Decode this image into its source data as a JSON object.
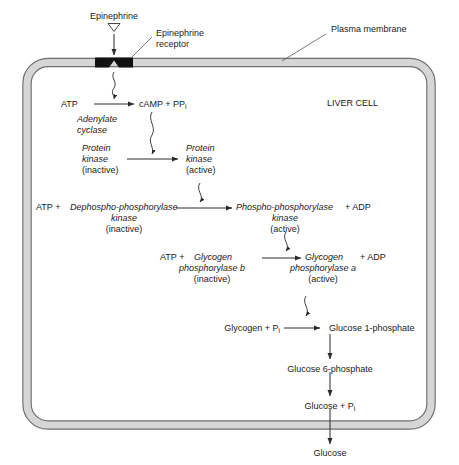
{
  "diagram": {
    "title_region": {
      "epinephrine": "Epinephrine",
      "epinephrine_receptor_line1": "Epinephrine",
      "epinephrine_receptor_line2": "receptor",
      "plasma_membrane": "Plasma membrane",
      "liver_cell": "LIVER CELL"
    },
    "step_camp": {
      "substrate": "ATP",
      "product": "cAMP + PP",
      "product_sub": "i",
      "enzyme_line1": "Adenylate",
      "enzyme_line2": "cyclase"
    },
    "step_protein_kinase": {
      "left_line1": "Protein",
      "left_line2": "kinase",
      "left_line3": "(inactive)",
      "right_line1": "Protein",
      "right_line2": "kinase",
      "right_line3": "(active)"
    },
    "step_phosphorylase_kinase": {
      "atp": "ATP +",
      "left_line1": "Dephospho-phosphorylase",
      "left_line2": "kinase",
      "left_line3": "(inactive)",
      "right_line1": "Phospho-phosphorylase",
      "right_line2": "kinase",
      "right_line3": "(active)",
      "adp": "+ ADP"
    },
    "step_glycogen_phosphorylase": {
      "atp": "ATP +",
      "left_line1": "Glycogen",
      "left_line2": "phosphorylase b",
      "left_line3": "(inactive)",
      "right_line1": "Glycogen",
      "right_line2": "phosphorylase a",
      "right_line3": "(active)",
      "adp": "+ ADP"
    },
    "step_glucose_path": {
      "glycogen": "Glycogen + P",
      "glycogen_sub": "i",
      "glucose_1_phosphate": "Glucose 1-phosphate",
      "glucose_6_phosphate": "Glucose 6-phosphate",
      "glucose_pi": "Glucose + P",
      "glucose_pi_sub": "i",
      "glucose": "Glucose"
    },
    "colors": {
      "membrane_fill": "#d6d6d6",
      "membrane_stroke": "#6e6e6e",
      "receptor": "#111111",
      "text": "#1a1a1a",
      "arrow": "#2a2a2a"
    }
  }
}
